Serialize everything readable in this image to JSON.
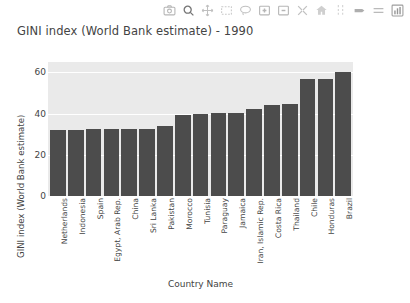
{
  "modebar": {
    "buttons": [
      {
        "name": "download-plot-icon",
        "label": "Download plot as a png"
      },
      {
        "name": "zoom-icon",
        "label": "Zoom"
      },
      {
        "name": "pan-icon",
        "label": "Pan"
      },
      {
        "name": "box-select-icon",
        "label": "Box Select"
      },
      {
        "name": "lasso-select-icon",
        "label": "Lasso Select"
      },
      {
        "name": "zoom-in-icon",
        "label": "Zoom in"
      },
      {
        "name": "zoom-out-icon",
        "label": "Zoom out"
      },
      {
        "name": "autoscale-icon",
        "label": "Autoscale"
      },
      {
        "name": "reset-axes-icon",
        "label": "Reset axes"
      },
      {
        "name": "spike-lines-icon",
        "label": "Toggle Spike Lines"
      },
      {
        "name": "hover-compare-icon",
        "label": "Show closest data on hover"
      },
      {
        "name": "hover-closest-icon",
        "label": "Compare data on hover"
      },
      {
        "name": "plotly-logo-icon",
        "label": "Produced with Plotly"
      }
    ]
  },
  "chart_data": {
    "type": "bar",
    "title": "GINI index (World Bank estimate) - 1990",
    "xlabel": "Country Name",
    "ylabel": "GINI index (World Bank estimate)",
    "ylim": [
      0,
      65
    ],
    "yticks": [
      0,
      20,
      40,
      60
    ],
    "grid": true,
    "legend": "none",
    "bar_color": "#4c4c4c",
    "plot_bg": "#eaeaea",
    "categories": [
      "Netherlands",
      "Indonesia",
      "Spain",
      "Egypt, Arab Rep.",
      "China",
      "Sri Lanka",
      "Pakistan",
      "Morocco",
      "Tunisia",
      "Paraguay",
      "Jamaica",
      "Iran, Islamic Rep.",
      "Costa Rica",
      "Thailand",
      "Chile",
      "Honduras",
      "Brazil"
    ],
    "values": [
      32,
      32,
      32.3,
      32.3,
      32.4,
      32.4,
      33.8,
      39.2,
      39.7,
      40.1,
      40.3,
      42.1,
      44.1,
      44.6,
      56.9,
      57,
      60.1
    ]
  }
}
